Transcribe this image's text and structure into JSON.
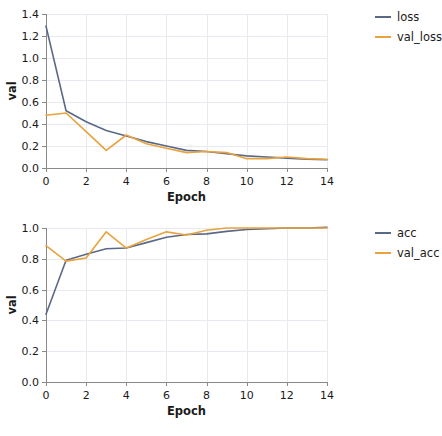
{
  "figure": {
    "width": 438,
    "height": 436,
    "background": "#ffffff",
    "colors": {
      "series_1": "#5a6987",
      "series_2": "#e8a33d",
      "axis": "#8a8a86",
      "grid": "#e9e9f2",
      "text": "#1a1a1a"
    }
  },
  "chart_data": [
    {
      "type": "line",
      "title": "",
      "xlabel": "Epoch",
      "ylabel": "val",
      "x": [
        0,
        1,
        2,
        3,
        4,
        5,
        6,
        7,
        8,
        9,
        10,
        11,
        12,
        13,
        14
      ],
      "xlim": [
        0,
        14
      ],
      "ylim": [
        0.0,
        1.4
      ],
      "xticks": [
        0,
        2,
        4,
        6,
        8,
        10,
        12,
        14
      ],
      "xticklabels": [
        "0",
        "2",
        "4",
        "6",
        "8",
        "10",
        "12",
        "14"
      ],
      "yticks": [
        0.0,
        0.2,
        0.4,
        0.6,
        0.8,
        1.0,
        1.2,
        1.4
      ],
      "yticklabels": [
        "0.0",
        "0.2",
        "0.4",
        "0.6",
        "0.8",
        "1.0",
        "1.2",
        "1.4"
      ],
      "grid": true,
      "legend_position": "right",
      "series": [
        {
          "name": "loss",
          "color": "#5a6987",
          "values": [
            1.29,
            0.52,
            0.42,
            0.34,
            0.29,
            0.24,
            0.2,
            0.16,
            0.15,
            0.13,
            0.11,
            0.1,
            0.09,
            0.08,
            0.075
          ]
        },
        {
          "name": "val_loss",
          "color": "#e8a33d",
          "values": [
            0.48,
            0.5,
            0.33,
            0.16,
            0.3,
            0.22,
            0.18,
            0.14,
            0.15,
            0.14,
            0.085,
            0.085,
            0.1,
            0.085,
            0.08
          ]
        }
      ]
    },
    {
      "type": "line",
      "title": "",
      "xlabel": "Epoch",
      "ylabel": "val",
      "x": [
        0,
        1,
        2,
        3,
        4,
        5,
        6,
        7,
        8,
        9,
        10,
        11,
        12,
        13,
        14
      ],
      "xlim": [
        0,
        14
      ],
      "ylim": [
        0.0,
        1.0
      ],
      "xticks": [
        0,
        2,
        4,
        6,
        8,
        10,
        12,
        14
      ],
      "xticklabels": [
        "0",
        "2",
        "4",
        "6",
        "8",
        "10",
        "12",
        "14"
      ],
      "yticks": [
        0.0,
        0.2,
        0.4,
        0.6,
        0.8,
        1.0
      ],
      "yticklabels": [
        "0.0",
        "0.2",
        "0.4",
        "0.6",
        "0.8",
        "1.0"
      ],
      "grid": true,
      "legend_position": "right",
      "series": [
        {
          "name": "acc",
          "color": "#5a6987",
          "values": [
            0.44,
            0.79,
            0.83,
            0.865,
            0.87,
            0.905,
            0.94,
            0.958,
            0.962,
            0.978,
            0.99,
            0.995,
            1.0,
            1.0,
            1.005
          ]
        },
        {
          "name": "val_acc",
          "color": "#e8a33d",
          "values": [
            0.885,
            0.785,
            0.805,
            0.975,
            0.87,
            0.925,
            0.975,
            0.955,
            0.985,
            1.0,
            1.0,
            1.0,
            1.0,
            1.0,
            1.0
          ]
        }
      ]
    }
  ]
}
